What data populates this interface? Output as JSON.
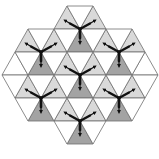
{
  "diagram": {
    "side": 26,
    "row_height": 23,
    "colors": {
      "white": "#ffffff",
      "light": "#d9d9d9",
      "dark": "#a3a3a3",
      "edge": "#6e6e6e",
      "arrow": "#111111"
    },
    "rows": [
      {
        "y": 6,
        "x_start": 67,
        "x_end": 93
      },
      {
        "y": 29,
        "x_start": 28,
        "x_end": 132
      },
      {
        "y": 52,
        "x_start": 15,
        "x_end": 145
      },
      {
        "y": 75,
        "x_start": 2,
        "x_end": 158
      },
      {
        "y": 98,
        "x_start": 15,
        "x_end": 145
      },
      {
        "y": 121,
        "x_start": 28,
        "x_end": 132
      },
      {
        "y": 144,
        "x_start": 67,
        "x_end": 93
      }
    ],
    "centers": [
      {
        "x": 80,
        "y": 29
      },
      {
        "x": 41,
        "y": 52
      },
      {
        "x": 119,
        "y": 52
      },
      {
        "x": 80,
        "y": 75
      },
      {
        "x": 41,
        "y": 98
      },
      {
        "x": 119,
        "y": 98
      },
      {
        "x": 80,
        "y": 121
      }
    ]
  }
}
